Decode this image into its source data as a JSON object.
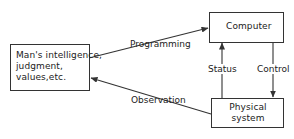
{
  "diagram": {
    "nodes": {
      "human": {
        "lines": [
          "Man's intelligence,",
          "judgment,",
          "values,etc."
        ]
      },
      "computer": {
        "label": "Computer"
      },
      "physical": {
        "lines": [
          "Physical",
          "system"
        ]
      }
    },
    "edges": {
      "programming": {
        "label": "Programming",
        "from": "human",
        "to": "computer"
      },
      "observation": {
        "label": "Observation",
        "from": "physical",
        "to": "human"
      },
      "status": {
        "label": "Status",
        "from": "physical",
        "to": "computer"
      },
      "control": {
        "label": "Control",
        "from": "computer",
        "to": "physical"
      }
    },
    "colors": {
      "line": "#333333",
      "text": "#222222",
      "background": "#ffffff"
    }
  }
}
